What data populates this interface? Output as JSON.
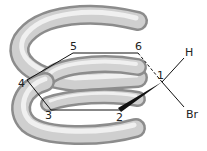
{
  "diagram": {
    "title": "",
    "type": "cyclohexane-helix-model",
    "atoms": [
      {
        "id": "1",
        "label": "1",
        "x": 162,
        "y": 82
      },
      {
        "id": "2",
        "label": "2",
        "x": 120,
        "y": 110
      },
      {
        "id": "3",
        "label": "3",
        "x": 51,
        "y": 110
      },
      {
        "id": "4",
        "label": "4",
        "x": 27,
        "y": 80
      },
      {
        "id": "5",
        "label": "5",
        "x": 73,
        "y": 53
      },
      {
        "id": "6",
        "label": "6",
        "x": 138,
        "y": 53
      }
    ],
    "substituents": [
      {
        "id": "H",
        "label": "H",
        "x": 188,
        "y": 52
      },
      {
        "id": "Br",
        "label": "Br",
        "x": 192,
        "y": 114
      }
    ],
    "bonds": [
      {
        "from": "1",
        "to": "2",
        "style": "wedge"
      },
      {
        "from": "2",
        "to": "3",
        "style": "plain"
      },
      {
        "from": "3",
        "to": "4",
        "style": "plain"
      },
      {
        "from": "4",
        "to": "5",
        "style": "plain"
      },
      {
        "from": "5",
        "to": "6",
        "style": "plain"
      },
      {
        "from": "6",
        "to": "1",
        "style": "dashed"
      },
      {
        "from": "1",
        "to": "H",
        "style": "plain"
      },
      {
        "from": "1",
        "to": "Br",
        "style": "plain"
      }
    ],
    "colors": {
      "tube_light": "#f2f2f2",
      "tube_mid": "#c8c8c8",
      "tube_dark": "#8c8c8c",
      "bond": "#111111",
      "label": "#222222"
    }
  }
}
